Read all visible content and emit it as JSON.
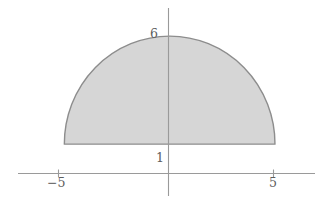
{
  "figure": {
    "kind": "shaded-region-plot",
    "background_color": "#ffffff",
    "axis_color": "#9a9a9a",
    "label_color": "#5d5d5d"
  },
  "labels": {
    "y_top": "6",
    "y_base": "1",
    "x_left": "−5",
    "x_right": "5"
  },
  "chart_data": {
    "type": "area",
    "title": "",
    "subtitle": "",
    "xlabel": "",
    "ylabel": "",
    "grid": false,
    "legend": "none",
    "xlim": [
      -7.2,
      6.9
    ],
    "ylim": [
      -1.4,
      7.3
    ],
    "x_axis": {
      "tick_values": [
        -5,
        5
      ],
      "tick_labels": [
        "−5",
        "5"
      ],
      "axis_y_value": 0,
      "pixel_span": [
        18,
        315
      ]
    },
    "y_axis": {
      "tick_values": [
        1,
        6
      ],
      "tick_labels": [
        "1",
        "6"
      ],
      "axis_x_value": 0,
      "pixel_span": [
        8,
        196
      ]
    },
    "shaded_region": {
      "name": "upper half-disk truncated at y=1",
      "fill_color": "#d6d6d6",
      "fill_opacity": 1,
      "edge_color": "#8d8d8d",
      "description": "Upper semicircle of radius 5 centered at origin, shifted so apex reads 6; region bounded below by the horizontal line y = 1 and above by the circular arc.",
      "circle_center": [
        0,
        1
      ],
      "circle_radius": 5,
      "arc_apex": [
        0,
        6
      ],
      "baseline_y": 1,
      "left_corner": [
        -5,
        1
      ],
      "right_corner": [
        5,
        1
      ],
      "boundary_points_xy": [
        [
          -5,
          1.0
        ],
        [
          -4.8,
          2.39
        ],
        [
          -4.5,
          3.18
        ],
        [
          -4.0,
          4.0
        ],
        [
          -3.5,
          4.57
        ],
        [
          -3.0,
          5.0
        ],
        [
          -2.5,
          5.33
        ],
        [
          -2.0,
          5.58
        ],
        [
          -1.5,
          5.77
        ],
        [
          -1.0,
          5.9
        ],
        [
          -0.5,
          5.97
        ],
        [
          0,
          6.0
        ],
        [
          0.5,
          5.97
        ],
        [
          1.0,
          5.9
        ],
        [
          1.5,
          5.77
        ],
        [
          2.0,
          5.58
        ],
        [
          2.5,
          5.33
        ],
        [
          3.0,
          5.0
        ],
        [
          3.5,
          4.57
        ],
        [
          4.0,
          4.0
        ],
        [
          4.5,
          3.18
        ],
        [
          4.8,
          2.39
        ],
        [
          5,
          1.0
        ]
      ]
    }
  }
}
